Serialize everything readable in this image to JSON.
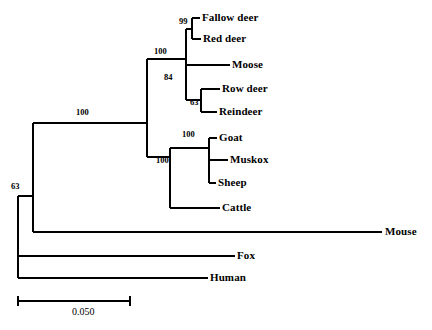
{
  "figure": {
    "type": "phylogenetic-tree",
    "style": "rectangular-cladogram",
    "background_color": "#ffffff",
    "line_color": "#000000",
    "line_width": 2
  },
  "scale_bar": {
    "label": "0.050",
    "x_start": 18,
    "x_end": 130,
    "y": 301,
    "tick_half_height": 5,
    "label_x": 72,
    "label_y": 306
  },
  "taxa": [
    {
      "name": "Fallow deer",
      "label_x": 202,
      "label_y": 12,
      "tip_x": 200,
      "tip_y": 18
    },
    {
      "name": "Red deer",
      "label_x": 203,
      "label_y": 33,
      "tip_x": 201,
      "tip_y": 39
    },
    {
      "name": "Moose",
      "label_x": 232,
      "label_y": 59,
      "tip_x": 230,
      "tip_y": 65
    },
    {
      "name": "Row deer",
      "label_x": 222,
      "label_y": 83,
      "tip_x": 220,
      "tip_y": 89
    },
    {
      "name": "Reindeer",
      "label_x": 219,
      "label_y": 106,
      "tip_x": 217,
      "tip_y": 112
    },
    {
      "name": "Goat",
      "label_x": 219,
      "label_y": 132,
      "tip_x": 217,
      "tip_y": 138
    },
    {
      "name": "Muskox",
      "label_x": 230,
      "label_y": 154,
      "tip_x": 228,
      "tip_y": 160
    },
    {
      "name": "Sheep",
      "label_x": 218,
      "label_y": 177,
      "tip_x": 216,
      "tip_y": 183
    },
    {
      "name": "Cattle",
      "label_x": 222,
      "label_y": 202,
      "tip_x": 220,
      "tip_y": 208
    },
    {
      "name": "Mouse",
      "label_x": 385,
      "label_y": 226,
      "tip_x": 382,
      "tip_y": 232
    },
    {
      "name": "Fox",
      "label_x": 237,
      "label_y": 250,
      "tip_x": 235,
      "tip_y": 256
    },
    {
      "name": "Human",
      "label_x": 210,
      "label_y": 272,
      "tip_x": 208,
      "tip_y": 278
    }
  ],
  "support_values": [
    {
      "value": "99",
      "label_x": 179,
      "label_y": 17,
      "node": "fallow-red-deer"
    },
    {
      "value": "100",
      "label_x": 154,
      "label_y": 47,
      "node": "cervidae"
    },
    {
      "value": "84",
      "label_x": 164,
      "label_y": 73,
      "node": "moose-roe-reindeer"
    },
    {
      "value": "63",
      "label_x": 190,
      "label_y": 98,
      "node": "roe-reindeer"
    },
    {
      "value": "100",
      "label_x": 182,
      "label_y": 130,
      "node": "goat-muskox-sheep"
    },
    {
      "value": "100",
      "label_x": 156,
      "label_y": 156,
      "node": "bovidae"
    },
    {
      "value": "100",
      "label_x": 76,
      "label_y": 108,
      "node": "ruminantia"
    },
    {
      "value": "63",
      "label_x": 11,
      "label_y": 182,
      "node": "root-clade"
    }
  ],
  "branches": [
    {
      "id": "tip-fallow-deer",
      "type": "horizontal",
      "x1": 192,
      "x2": 200,
      "y": 18
    },
    {
      "id": "tip-red-deer",
      "type": "horizontal",
      "x1": 192,
      "x2": 201,
      "y": 39
    },
    {
      "id": "node-99-vertical",
      "type": "vertical",
      "x": 192,
      "y1": 18,
      "y2": 39
    },
    {
      "id": "stem-99",
      "type": "horizontal",
      "x1": 186,
      "x2": 192,
      "y": 29
    },
    {
      "id": "tip-moose",
      "type": "horizontal",
      "x1": 186,
      "x2": 230,
      "y": 65
    },
    {
      "id": "tip-row-deer",
      "type": "horizontal",
      "x1": 201,
      "x2": 220,
      "y": 89
    },
    {
      "id": "tip-reindeer",
      "type": "horizontal",
      "x1": 201,
      "x2": 217,
      "y": 112
    },
    {
      "id": "node-63-vertical",
      "type": "vertical",
      "x": 201,
      "y1": 89,
      "y2": 112
    },
    {
      "id": "stem-63",
      "type": "horizontal",
      "x1": 186,
      "x2": 201,
      "y": 100
    },
    {
      "id": "node-84-vertical",
      "type": "vertical",
      "x": 186,
      "y1": 65,
      "y2": 100
    },
    {
      "id": "stem-84",
      "type": "horizontal",
      "x1": 147,
      "x2": 186,
      "y": 59
    },
    {
      "id": "node-cervid-vertical",
      "type": "vertical",
      "x": 186,
      "y1": 29,
      "y2": 65
    },
    {
      "id": "tip-goat",
      "type": "horizontal",
      "x1": 209,
      "x2": 217,
      "y": 138
    },
    {
      "id": "tip-muskox",
      "type": "horizontal",
      "x1": 209,
      "x2": 228,
      "y": 160
    },
    {
      "id": "tip-sheep",
      "type": "horizontal",
      "x1": 209,
      "x2": 216,
      "y": 183
    },
    {
      "id": "node-goat-vertical",
      "type": "vertical",
      "x": 209,
      "y1": 138,
      "y2": 183
    },
    {
      "id": "stem-goat-clade",
      "type": "horizontal",
      "x1": 170,
      "x2": 209,
      "y": 148
    },
    {
      "id": "tip-cattle",
      "type": "horizontal",
      "x1": 170,
      "x2": 220,
      "y": 208
    },
    {
      "id": "node-bovid-vertical",
      "type": "vertical",
      "x": 170,
      "y1": 148,
      "y2": 208
    },
    {
      "id": "stem-bovidae",
      "type": "horizontal",
      "x1": 147,
      "x2": 170,
      "y": 157
    },
    {
      "id": "node-ruminant-vertical",
      "type": "vertical",
      "x": 147,
      "y1": 59,
      "y2": 157
    },
    {
      "id": "stem-ruminantia",
      "type": "horizontal",
      "x1": 33,
      "x2": 147,
      "y": 123
    },
    {
      "id": "tip-mouse",
      "type": "horizontal",
      "x1": 33,
      "x2": 382,
      "y": 232
    },
    {
      "id": "node-inner-vertical",
      "type": "vertical",
      "x": 33,
      "y1": 123,
      "y2": 232
    },
    {
      "id": "stem-inner",
      "type": "horizontal",
      "x1": 18,
      "x2": 33,
      "y": 196
    },
    {
      "id": "tip-fox",
      "type": "horizontal",
      "x1": 18,
      "x2": 235,
      "y": 256
    },
    {
      "id": "tip-human",
      "type": "horizontal",
      "x1": 18,
      "x2": 208,
      "y": 278
    },
    {
      "id": "node-root-vertical",
      "type": "vertical",
      "x": 18,
      "y1": 196,
      "y2": 278
    }
  ]
}
